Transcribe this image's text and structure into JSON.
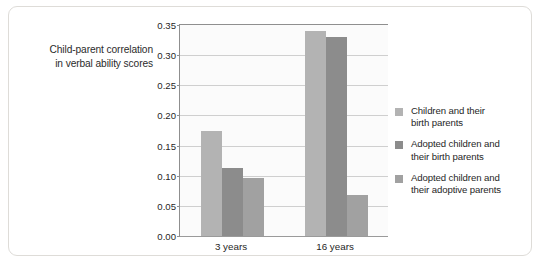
{
  "chart_data": {
    "type": "bar",
    "title": "",
    "xlabel": "",
    "ylabel": "Child-parent correlation in verbal ability scores",
    "ylabel_line1": "Child-parent correlation",
    "ylabel_line2": "in verbal ability scores",
    "categories": [
      "3 years",
      "16 years"
    ],
    "series": [
      {
        "name": "Children and their birth parents",
        "name_line1": "Children and their",
        "name_line2": "birth parents",
        "color": "#b3b3b3",
        "values": [
          0.175,
          0.34
        ]
      },
      {
        "name": "Adopted children and their birth parents",
        "name_line1": "Adopted children and",
        "name_line2": "their birth parents",
        "color": "#8c8c8c",
        "values": [
          0.112,
          0.33
        ]
      },
      {
        "name": "Adopted children and their adoptive parents",
        "name_line1": "Adopted children and",
        "name_line2": "their adoptive parents",
        "color": "#a1a1a1",
        "values": [
          0.097,
          0.068
        ]
      }
    ],
    "ylim": [
      0.0,
      0.35
    ],
    "ytick_step": 0.05,
    "ytick_labels": [
      "0.00",
      "0.05",
      "0.10",
      "0.15",
      "0.20",
      "0.25",
      "0.30",
      "0.35"
    ],
    "ytick_values": [
      0.0,
      0.05,
      0.1,
      0.15,
      0.2,
      0.25,
      0.3,
      0.35
    ],
    "grid": true,
    "legend_position": "right",
    "plot_background": "#fbfbfb",
    "gridline_color": "#cfcfcf",
    "axis_color": "#8f8f8f"
  }
}
